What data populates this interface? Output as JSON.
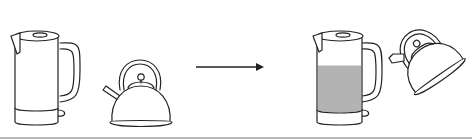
{
  "diagram": {
    "left_scene": {
      "items": [
        "electric-kettle-empty",
        "stovetop-kettle"
      ]
    },
    "arrow": {
      "direction": "right"
    },
    "right_scene": {
      "items": [
        "electric-kettle-filled",
        "stovetop-kettle-tilted"
      ],
      "water_fill_fraction": 0.62
    },
    "colors": {
      "line": "#222222",
      "water": "#b3b3b3",
      "background": "#ffffff",
      "bottom_rule": "#b8b8b8"
    }
  }
}
